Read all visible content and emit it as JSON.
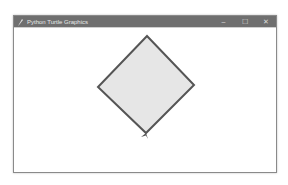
{
  "window": {
    "title": "Python Turtle Graphics",
    "icon": "feather-icon",
    "controls": {
      "minimize": "–",
      "maximize": "☐",
      "close": "✕"
    }
  },
  "canvas": {
    "background": "#ffffff",
    "shape": {
      "type": "diamond",
      "points": [
        [
          147,
          36
        ],
        [
          194,
          85
        ],
        [
          146,
          133
        ],
        [
          98,
          87
        ]
      ],
      "fill": "#e6e6e6",
      "stroke": "#555555",
      "stroke_width": 2
    },
    "turtle": {
      "shape": "arrow",
      "position": [
        146,
        133
      ],
      "color": "#555555"
    }
  }
}
